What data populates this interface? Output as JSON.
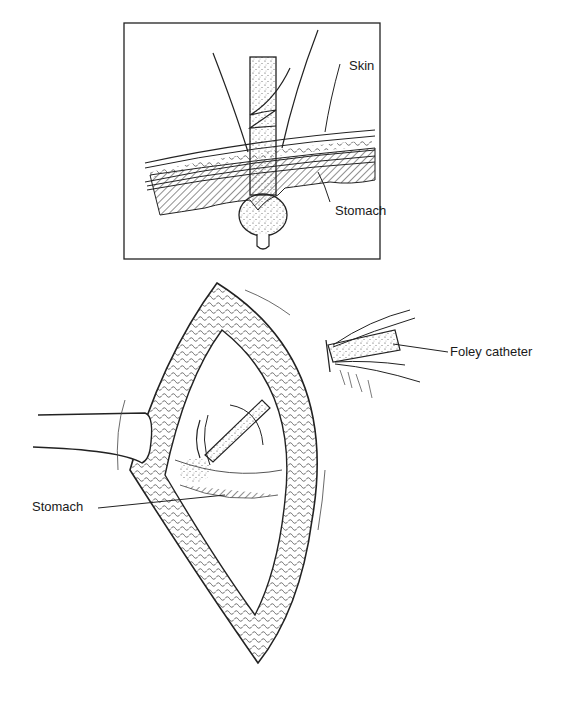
{
  "figure": {
    "inset": {
      "labels": {
        "skin": "Skin",
        "stomach": "Stomach"
      }
    },
    "main": {
      "labels": {
        "foley_catheter": "Foley catheter",
        "stomach": "Stomach"
      }
    }
  }
}
